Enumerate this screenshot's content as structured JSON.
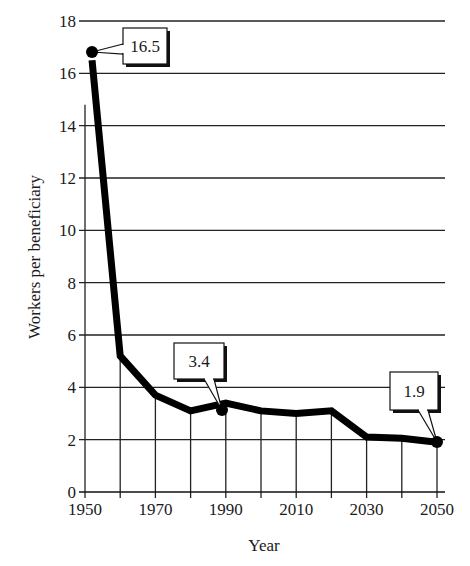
{
  "chart_data": {
    "type": "line",
    "title": "",
    "xlabel": "Year",
    "ylabel": "Workers per beneficiary",
    "xlim": [
      1950,
      2050
    ],
    "ylim": [
      0,
      18
    ],
    "x_ticks": [
      1950,
      1960,
      1970,
      1980,
      1990,
      2000,
      2010,
      2020,
      2030,
      2040,
      2050
    ],
    "x_tick_labels": [
      "1950",
      "",
      "1970",
      "",
      "1990",
      "",
      "2010",
      "",
      "2030",
      "",
      "2050"
    ],
    "y_ticks": [
      0,
      2,
      4,
      6,
      8,
      10,
      12,
      14,
      16,
      18
    ],
    "y_tick_labels": [
      "0",
      "2",
      "4",
      "6",
      "8",
      "10",
      "12",
      "14",
      "16",
      "18"
    ],
    "grid": {
      "horizontal": true,
      "vertical": "below-line-only"
    },
    "legend": null,
    "series": [
      {
        "name": "Workers per beneficiary",
        "x": [
          1952,
          1960,
          1970,
          1980,
          1990,
          2000,
          2010,
          2020,
          2030,
          2040,
          2050
        ],
        "values": [
          16.5,
          5.2,
          3.7,
          3.1,
          3.4,
          3.1,
          3.0,
          3.1,
          2.1,
          2.05,
          1.9
        ]
      }
    ],
    "annotations": [
      {
        "x": 1952,
        "y": 16.5,
        "label": "16.5",
        "marker": "dot"
      },
      {
        "x": 1990,
        "y": 3.4,
        "label": "3.4",
        "marker": "dot"
      },
      {
        "x": 2050,
        "y": 1.9,
        "label": "1.9",
        "marker": "dot"
      }
    ]
  },
  "layout": {
    "plot_left": 85,
    "plot_right": 445,
    "x_at_1950": 85,
    "x_at_2050": 437,
    "y_at_0": 492,
    "y_at_18": 21,
    "line_color": "#000000",
    "grid_color": "#222222",
    "callouts": [
      {
        "box": [
          123,
          28,
          44,
          36
        ],
        "tail_to": [
          92,
          52
        ],
        "tail_base": [
          123,
          44,
          123,
          54
        ]
      },
      {
        "box": [
          174,
          343,
          50,
          36
        ],
        "tail_to": [
          222,
          410
        ],
        "tail_base": [
          204,
          379,
          214,
          379
        ]
      },
      {
        "box": [
          390,
          372,
          48,
          38
        ],
        "tail_to": [
          437,
          442
        ],
        "tail_base": [
          418,
          410,
          428,
          410
        ]
      }
    ]
  }
}
